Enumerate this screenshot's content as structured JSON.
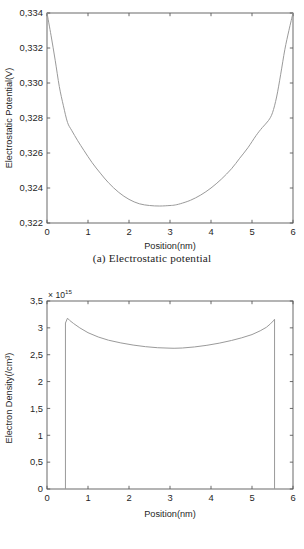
{
  "figure": {
    "panels": [
      {
        "id": "a",
        "caption": "(a)  Electrostatic  potential"
      },
      {
        "id": "b",
        "caption": "(b)  Electron  density"
      }
    ]
  },
  "chart_data": [
    {
      "type": "line",
      "panel": "a",
      "title": "(a) Electrostatic potential",
      "xlabel": "Position(nm)",
      "ylabel": "Electrostatic Potential(V)",
      "xlim": [
        0,
        6
      ],
      "ylim": [
        0.322,
        0.334
      ],
      "grid": false,
      "legend": null,
      "xticks": [
        0,
        1,
        2,
        3,
        4,
        5,
        6
      ],
      "xticklabels": [
        "0",
        "1",
        "2",
        "3",
        "4",
        "5",
        "6"
      ],
      "yticks": [
        0.322,
        0.324,
        0.326,
        0.328,
        0.33,
        0.332,
        0.334
      ],
      "yticklabels": [
        "0,322",
        "0,324",
        "0,326",
        "0,328",
        "0,330",
        "0,332",
        "0,334"
      ],
      "series": [
        {
          "name": "electrostatic potential",
          "color": "#9a9a9a",
          "x": [
            0.0,
            0.1,
            0.2,
            0.3,
            0.4,
            0.5,
            0.6,
            0.75,
            0.9,
            1.1,
            1.3,
            1.5,
            1.75,
            2.0,
            2.25,
            2.5,
            2.75,
            3.0,
            3.1,
            3.25,
            3.5,
            3.75,
            4.0,
            4.25,
            4.5,
            4.7,
            4.9,
            5.1,
            5.25,
            5.4,
            5.5,
            5.6,
            5.7,
            5.8,
            5.9,
            6.0
          ],
          "y": [
            0.334,
            0.3327,
            0.3313,
            0.3298,
            0.3287,
            0.32775,
            0.3273,
            0.3267,
            0.32615,
            0.32545,
            0.32485,
            0.3243,
            0.32375,
            0.32335,
            0.3231,
            0.323,
            0.32297,
            0.323,
            0.32302,
            0.3231,
            0.3233,
            0.3236,
            0.324,
            0.3245,
            0.3251,
            0.3257,
            0.3263,
            0.327,
            0.32745,
            0.32785,
            0.3283,
            0.3292,
            0.3305,
            0.3319,
            0.333,
            0.334
          ]
        }
      ]
    },
    {
      "type": "line",
      "panel": "b",
      "title": "(b) Electron density",
      "xlabel": "Position(nm)",
      "ylabel": "Electron Density(/cm³)",
      "y_multiplier_text": "× 10",
      "y_multiplier_exponent": "15",
      "y_multiplier_value": 1000000000000000.0,
      "xlim": [
        0,
        6
      ],
      "ylim": [
        0,
        3.5
      ],
      "grid": false,
      "legend": null,
      "xticks": [
        0,
        1,
        2,
        3,
        4,
        5,
        6
      ],
      "xticklabels": [
        "0",
        "1",
        "2",
        "3",
        "4",
        "5",
        "6"
      ],
      "yticks": [
        0,
        0.5,
        1,
        1.5,
        2,
        2.5,
        3,
        3.5
      ],
      "yticklabels": [
        "0",
        "0,5",
        "1",
        "1,5",
        "2",
        "2,5",
        "3",
        "3,5"
      ],
      "series": [
        {
          "name": "electron density",
          "color": "#9a9a9a",
          "x": [
            0.45,
            0.45,
            0.5,
            0.55,
            0.65,
            0.8,
            1.0,
            1.25,
            1.5,
            1.8,
            2.1,
            2.4,
            2.7,
            3.0,
            3.1,
            3.3,
            3.6,
            3.9,
            4.2,
            4.5,
            4.75,
            5.0,
            5.2,
            5.35,
            5.45,
            5.52,
            5.55,
            5.55
          ],
          "y": [
            0.0,
            3.09,
            3.18,
            3.14,
            3.08,
            3.0,
            2.91,
            2.83,
            2.77,
            2.72,
            2.68,
            2.65,
            2.63,
            2.622,
            2.62,
            2.625,
            2.645,
            2.675,
            2.715,
            2.765,
            2.815,
            2.875,
            2.945,
            3.01,
            3.075,
            3.13,
            3.16,
            0.0
          ]
        }
      ]
    }
  ]
}
